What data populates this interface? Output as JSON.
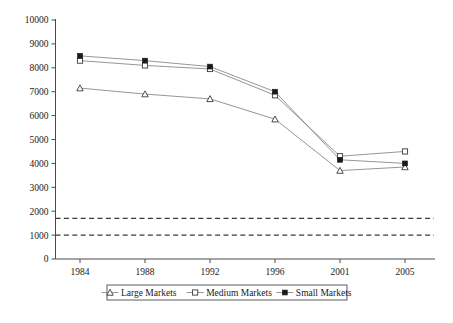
{
  "chart_data": {
    "type": "line",
    "title": "",
    "subtitle": "",
    "xlabel": "",
    "ylabel": "",
    "categories": [
      "1984",
      "1988",
      "1992",
      "1996",
      "2001",
      "2005"
    ],
    "ylim": [
      0,
      10000
    ],
    "ytick_step": 1000,
    "yticks": [
      "0",
      "1000",
      "2000",
      "3000",
      "4000",
      "5000",
      "6000",
      "7000",
      "8000",
      "9000",
      "10000"
    ],
    "grid": false,
    "legend_position": "bottom",
    "series": [
      {
        "name": "Large Markets",
        "marker": "open-triangle",
        "color": "#8a8a8a",
        "values": [
          7150,
          6900,
          6700,
          5850,
          3700,
          3850
        ]
      },
      {
        "name": "Medium Markets",
        "marker": "open-square",
        "color": "#8a8a8a",
        "values": [
          8300,
          8100,
          7950,
          6850,
          4300,
          4500
        ]
      },
      {
        "name": "Small Markets",
        "marker": "filled-square",
        "color": "#8a8a8a",
        "values": [
          8500,
          8300,
          8050,
          7000,
          4150,
          4000
        ]
      }
    ],
    "reference_lines": [
      {
        "name": "upper-threshold",
        "value": 1700,
        "style": "dashed"
      },
      {
        "name": "lower-threshold",
        "value": 1000,
        "style": "dashed"
      }
    ],
    "annotations": []
  },
  "caption": {
    "text": ""
  }
}
